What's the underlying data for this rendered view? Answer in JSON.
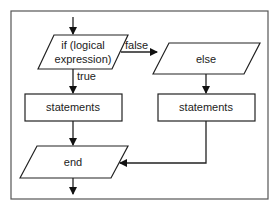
{
  "diagram": {
    "type": "flowchart",
    "condition": {
      "label_line1": "if (logical",
      "label_line2": "expression)"
    },
    "true_label": "true",
    "false_label": "false",
    "else_box": {
      "label": "else"
    },
    "true_statements": {
      "label": "statements"
    },
    "false_statements": {
      "label": "statements"
    },
    "end_box": {
      "label": "end"
    }
  }
}
